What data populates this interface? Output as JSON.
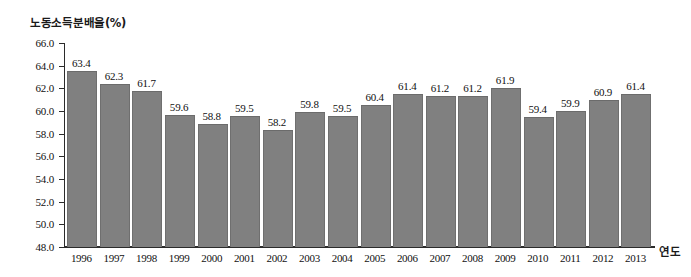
{
  "chart_data": {
    "type": "bar",
    "title": "",
    "xlabel": "연도",
    "ylabel": "노동소득분배율(%)",
    "ylim": [
      48.0,
      66.0
    ],
    "ytick_step": 2.0,
    "yticks": [
      "66.0",
      "64.0",
      "62.0",
      "60.0",
      "58.0",
      "56.0",
      "54.0",
      "52.0",
      "50.0",
      "48.0"
    ],
    "ytick_values": [
      66.0,
      64.0,
      62.0,
      60.0,
      58.0,
      56.0,
      54.0,
      52.0,
      50.0,
      48.0
    ],
    "grid": false,
    "legend": "none",
    "bar_color": "#808080",
    "axis_color": "#2b2b2b",
    "background": "#ffffff",
    "categories": [
      "1996",
      "1997",
      "1998",
      "1999",
      "2000",
      "2001",
      "2002",
      "2003",
      "2004",
      "2005",
      "2006",
      "2007",
      "2008",
      "2009",
      "2010",
      "2011",
      "2012",
      "2013"
    ],
    "values": [
      63.4,
      62.3,
      61.7,
      59.6,
      58.8,
      59.5,
      58.2,
      59.8,
      59.5,
      60.4,
      61.4,
      61.2,
      61.2,
      61.9,
      59.4,
      59.9,
      60.9,
      61.4
    ],
    "value_labels": [
      "63.4",
      "62.3",
      "61.7",
      "59.6",
      "58.8",
      "59.5",
      "58.2",
      "59.8",
      "59.5",
      "60.4",
      "61.4",
      "61.2",
      "61.2",
      "61.9",
      "59.4",
      "59.9",
      "60.9",
      "61.4"
    ]
  }
}
